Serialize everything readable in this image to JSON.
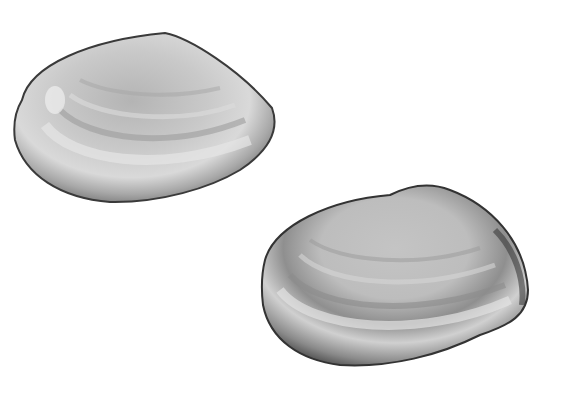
{
  "scene": {
    "description": "Two bivalve clam shells (left valve and right valve) on white background",
    "background": "#ffffff",
    "shells": [
      {
        "name": "upper-left shell",
        "fill_light": "#d8d8d8",
        "fill_mid": "#a9a9a9",
        "edge": "#3a3a3a"
      },
      {
        "name": "lower-right shell",
        "fill_light": "#dcdcdc",
        "fill_mid": "#a4a4a4",
        "edge": "#333333"
      }
    ]
  }
}
